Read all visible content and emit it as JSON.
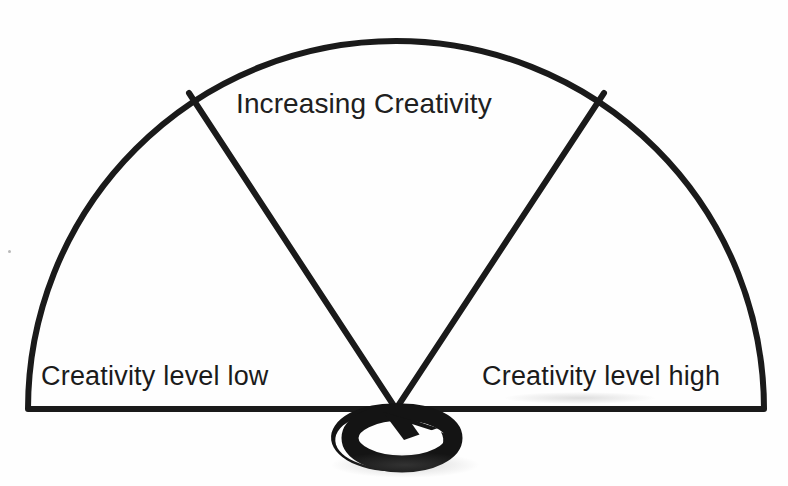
{
  "diagram": {
    "title_text": "Increasing Creativity",
    "left_label": "Creativity level low",
    "right_label": "Creativity level high",
    "shape": "semicircle-gauge",
    "sector_count": 3,
    "colors": {
      "stroke": "#1a1a1a",
      "background": "#ffffff",
      "text": "#1b1b1b",
      "arrow_icon": "#141414"
    },
    "geometry": {
      "center_x": 396,
      "center_y": 409,
      "radius": 368,
      "arc_start_angle_deg": 180,
      "arc_end_angle_deg": 0,
      "divider_left_angle_deg": 147,
      "divider_right_angle_deg": 33,
      "stroke_width_px": 6
    },
    "sectors": [
      {
        "name": "left-sector",
        "label": "Creativity level low"
      },
      {
        "name": "middle-sector",
        "label": "Increasing Creativity"
      },
      {
        "name": "right-sector",
        "label": "Creativity level high"
      }
    ],
    "icons": {
      "rotate_icon": "circular-rotate-arrow-icon",
      "rotate_icon_label": "rotation"
    }
  }
}
